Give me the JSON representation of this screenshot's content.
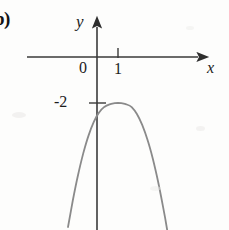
{
  "figure": {
    "part_label": "b)",
    "background_color": "#fdfdfc",
    "ink_color": "#1c1c1c",
    "curve_color": "#8a8a8a",
    "axis_color": "#3a3a3a"
  },
  "axes": {
    "x_axis_name": "x",
    "y_axis_name": "y",
    "origin_label": "0",
    "x_tick_labels": [
      "1"
    ],
    "y_tick_labels": [
      "-2"
    ],
    "x_axis_pixel_y": 57,
    "y_axis_pixel_x": 97,
    "x_unit_pixels": 21,
    "y_unit_pixels": 23
  },
  "chart_data": {
    "type": "line",
    "title": "",
    "subtitle": "",
    "xlabel": "x",
    "ylabel": "y",
    "grid": false,
    "legend": null,
    "curve_style": "smooth parabola opening downward",
    "vertex": [
      1,
      -2
    ],
    "equation": "y = a(x - 1)^2 - 2, a < 0",
    "xlim": [
      -1.4,
      3.4
    ],
    "ylim": [
      -7.5,
      0.6
    ],
    "xticks": [
      0,
      1
    ],
    "xticklabels": [
      "0",
      "1"
    ],
    "yticks": [
      -2
    ],
    "yticklabels": [
      "-2"
    ],
    "series": [
      {
        "name": "parabola",
        "x": [
          -1.38,
          -1.15,
          -0.9,
          -0.65,
          -0.4,
          -0.15,
          0.1,
          0.35,
          0.6,
          0.85,
          1.0,
          1.15,
          1.4,
          1.65,
          1.9,
          2.15,
          2.4,
          2.65,
          2.9,
          3.15,
          3.34
        ],
        "y": [
          -7.39,
          -6.24,
          -5.12,
          -4.18,
          -3.41,
          -2.82,
          -2.41,
          -2.17,
          -2.06,
          -2.01,
          -2.0,
          -2.01,
          -2.06,
          -2.18,
          -2.48,
          -2.95,
          -3.59,
          -4.4,
          -5.38,
          -6.53,
          -7.5
        ]
      }
    ],
    "annotations": [
      {
        "text": "b)",
        "position": "top-left-margin"
      }
    ]
  }
}
